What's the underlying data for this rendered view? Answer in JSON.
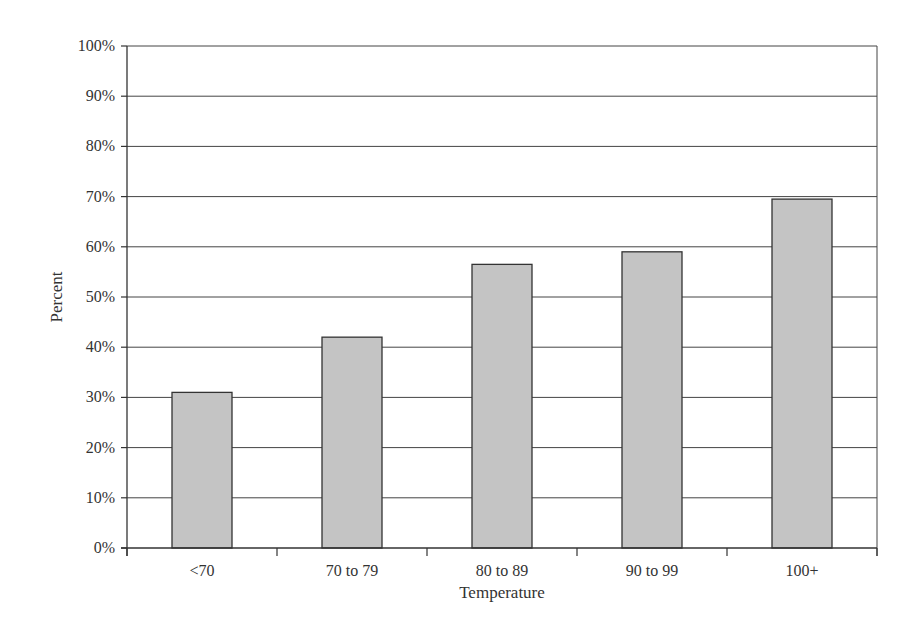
{
  "chart_data": {
    "type": "bar",
    "title": "",
    "xlabel": "Temperature",
    "ylabel": "Percent",
    "categories": [
      "<70",
      "70 to 79",
      "80 to 89",
      "90 to 99",
      "100+"
    ],
    "values": [
      31,
      42,
      56.5,
      59,
      69.5
    ],
    "ylim": [
      0,
      100
    ],
    "yticks": [
      "0%",
      "10%",
      "20%",
      "30%",
      "40%",
      "50%",
      "60%",
      "70%",
      "80%",
      "90%",
      "100%"
    ],
    "grid": true,
    "legend": null,
    "bar_color": "#c4c4c4",
    "bar_edge_color": "#333333"
  }
}
